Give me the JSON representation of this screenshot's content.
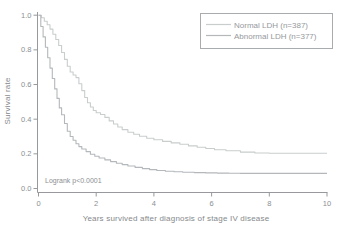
{
  "colors": {
    "background": "#ffffff",
    "axis": "#97999c",
    "tick_text": "#8b8f92",
    "axis_title_text": "#85898c",
    "legend_border": "#a8acae",
    "legend_text": "#96999c"
  },
  "chart_data": {
    "type": "line",
    "subtype": "kaplan-meier-step",
    "title": "",
    "xlabel": "Years survived after diagnosis of stage IV disease",
    "ylabel": "Survival rate",
    "annotation": "Logrank p<0.0001",
    "xlim": [
      0,
      10
    ],
    "ylim": [
      0.0,
      1.0
    ],
    "xticks": [
      "0",
      "2",
      "4",
      "6",
      "8",
      "10"
    ],
    "yticks": [
      "0.0",
      "0.2",
      "0.4",
      "0.6",
      "0.8",
      "1.0"
    ],
    "grid": false,
    "legend_position": "top-right",
    "series": [
      {
        "name": "Normal LDH (n=387)",
        "slug": "normal-ldh",
        "color": "#c9cdce",
        "points": [
          [
            0,
            1.0
          ],
          [
            0.1,
            0.985
          ],
          [
            0.2,
            0.965
          ],
          [
            0.3,
            0.945
          ],
          [
            0.4,
            0.92
          ],
          [
            0.5,
            0.89
          ],
          [
            0.6,
            0.86
          ],
          [
            0.7,
            0.825
          ],
          [
            0.8,
            0.785
          ],
          [
            0.9,
            0.745
          ],
          [
            1.0,
            0.705
          ],
          [
            1.1,
            0.672
          ],
          [
            1.2,
            0.655
          ],
          [
            1.3,
            0.64
          ],
          [
            1.4,
            0.605
          ],
          [
            1.5,
            0.565
          ],
          [
            1.6,
            0.525
          ],
          [
            1.7,
            0.495
          ],
          [
            1.8,
            0.47
          ],
          [
            1.9,
            0.45
          ],
          [
            2.0,
            0.437
          ],
          [
            2.15,
            0.427
          ],
          [
            2.3,
            0.41
          ],
          [
            2.45,
            0.39
          ],
          [
            2.6,
            0.372
          ],
          [
            2.75,
            0.355
          ],
          [
            2.9,
            0.34
          ],
          [
            3.1,
            0.325
          ],
          [
            3.3,
            0.313
          ],
          [
            3.5,
            0.302
          ],
          [
            3.75,
            0.29
          ],
          [
            4.0,
            0.281
          ],
          [
            4.3,
            0.272
          ],
          [
            4.6,
            0.263
          ],
          [
            4.9,
            0.255
          ],
          [
            5.2,
            0.246
          ],
          [
            5.5,
            0.238
          ],
          [
            5.8,
            0.231
          ],
          [
            6.1,
            0.224
          ],
          [
            6.5,
            0.218
          ],
          [
            7.0,
            0.21
          ],
          [
            7.5,
            0.205
          ],
          [
            8.0,
            0.203
          ],
          [
            10,
            0.203
          ]
        ]
      },
      {
        "name": "Abnormal LDH (n=377)",
        "slug": "abnormal-ldh",
        "color": "#b4b8ba",
        "points": [
          [
            0,
            1.0
          ],
          [
            0.08,
            0.935
          ],
          [
            0.16,
            0.875
          ],
          [
            0.24,
            0.815
          ],
          [
            0.32,
            0.755
          ],
          [
            0.4,
            0.695
          ],
          [
            0.48,
            0.635
          ],
          [
            0.56,
            0.575
          ],
          [
            0.64,
            0.52
          ],
          [
            0.72,
            0.465
          ],
          [
            0.8,
            0.425
          ],
          [
            0.9,
            0.375
          ],
          [
            1.0,
            0.33
          ],
          [
            1.1,
            0.3
          ],
          [
            1.2,
            0.278
          ],
          [
            1.3,
            0.258
          ],
          [
            1.4,
            0.242
          ],
          [
            1.5,
            0.228
          ],
          [
            1.65,
            0.213
          ],
          [
            1.8,
            0.198
          ],
          [
            1.95,
            0.186
          ],
          [
            2.1,
            0.176
          ],
          [
            2.3,
            0.165
          ],
          [
            2.5,
            0.155
          ],
          [
            2.7,
            0.146
          ],
          [
            2.9,
            0.138
          ],
          [
            3.1,
            0.13
          ],
          [
            3.35,
            0.122
          ],
          [
            3.6,
            0.115
          ],
          [
            3.85,
            0.109
          ],
          [
            4.1,
            0.104
          ],
          [
            4.4,
            0.1
          ],
          [
            4.7,
            0.097
          ],
          [
            5.0,
            0.094
          ],
          [
            5.4,
            0.092
          ],
          [
            5.8,
            0.09
          ],
          [
            6.2,
            0.089
          ],
          [
            6.6,
            0.088
          ],
          [
            7.0,
            0.087
          ],
          [
            10,
            0.087
          ]
        ]
      }
    ]
  }
}
